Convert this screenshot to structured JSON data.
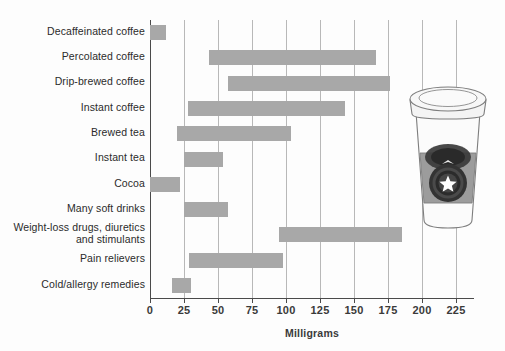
{
  "chart_data": {
    "type": "bar",
    "subtype": "horizontal-range-bar",
    "title": "",
    "xlabel": "Milligrams",
    "ylabel": "",
    "xlim": [
      0,
      235
    ],
    "xticks": [
      0,
      25,
      50,
      75,
      100,
      125,
      150,
      175,
      200,
      225
    ],
    "xticklabels": [
      "0",
      "25",
      "50",
      "75",
      "100",
      "125",
      "150",
      "175",
      "200",
      "225"
    ],
    "grid": "vertical",
    "legend": "none",
    "bar_color": "#a8a8a8",
    "categories": [
      "Decaffeinated coffee",
      "Percolated coffee",
      "Drip-brewed coffee",
      "Instant coffee",
      "Brewed tea",
      "Instant tea",
      "Cocoa",
      "Many soft drinks",
      "Weight-loss drugs, diuretics and stimulants",
      "Pain relievers",
      "Cold/allergy remedies"
    ],
    "ranges": [
      {
        "category": "Decaffeinated coffee",
        "low": 0,
        "high": 12
      },
      {
        "category": "Percolated coffee",
        "low": 43,
        "high": 166
      },
      {
        "category": "Drip-brewed coffee",
        "low": 57,
        "high": 176
      },
      {
        "category": "Instant coffee",
        "low": 28,
        "high": 143
      },
      {
        "category": "Brewed tea",
        "low": 20,
        "high": 104
      },
      {
        "category": "Instant tea",
        "low": 25,
        "high": 54
      },
      {
        "category": "Cocoa",
        "low": 0,
        "high": 22
      },
      {
        "category": "Many soft drinks",
        "low": 25,
        "high": 57
      },
      {
        "category": "Weight-loss drugs, diuretics and stimulants",
        "low": 95,
        "high": 185
      },
      {
        "category": "Pain relievers",
        "low": 29,
        "high": 98
      },
      {
        "category": "Cold/allergy remedies",
        "low": 16,
        "high": 30
      }
    ]
  },
  "labels": {
    "rows": [
      {
        "lines": [
          "Decaffeinated coffee"
        ]
      },
      {
        "lines": [
          "Percolated coffee"
        ]
      },
      {
        "lines": [
          "Drip-brewed coffee"
        ]
      },
      {
        "lines": [
          "Instant coffee"
        ]
      },
      {
        "lines": [
          "Brewed tea"
        ]
      },
      {
        "lines": [
          "Instant tea"
        ]
      },
      {
        "lines": [
          "Cocoa"
        ]
      },
      {
        "lines": [
          "Many soft drinks"
        ]
      },
      {
        "lines": [
          "Weight-loss drugs, diuretics",
          "and stimulants"
        ]
      },
      {
        "lines": [
          "Pain relievers"
        ]
      },
      {
        "lines": [
          "Cold/allergy remedies"
        ]
      }
    ]
  },
  "illustration": {
    "name": "coffee-cup",
    "lid_color": "#f2f2f2",
    "sleeve_color": "#9a9a9a",
    "logo_color": "#2e2e2e",
    "star_color": "#ffffff"
  },
  "colors": {
    "bar": "#a8a8a8",
    "axis": "#4a4a4a",
    "gridline": "#b8b8b8",
    "text": "#2b2b2b",
    "background": "#fdfdfd"
  }
}
